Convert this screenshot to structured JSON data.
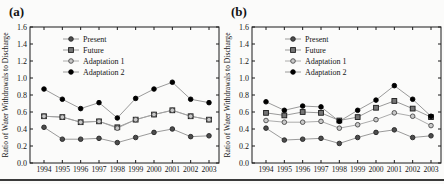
{
  "figure": {
    "background": "#fbfbfa",
    "frame_color": "#1a1a1a",
    "bottom_rule_color": "#3a3a3a"
  },
  "chart_data": [
    {
      "type": "line",
      "panel_label": "(a)",
      "title": "",
      "xlabel": "",
      "ylabel": "Ratio of Water Withdrawals to Discharge",
      "x": [
        1994,
        1995,
        1996,
        1997,
        1998,
        1999,
        2000,
        2001,
        2002,
        2003
      ],
      "ylim": [
        0.0,
        1.6
      ],
      "yticks": [
        0.0,
        0.2,
        0.4,
        0.6,
        0.8,
        1.0,
        1.2,
        1.4,
        1.6
      ],
      "grid": false,
      "legend_position": "upper-left-inside",
      "series": [
        {
          "name": "Present",
          "marker": "circle",
          "marker_fill": "#4d4d4d",
          "marker_stroke": "#262626",
          "line_color": "#8f8f8f",
          "values": [
            0.42,
            0.28,
            0.28,
            0.29,
            0.24,
            0.3,
            0.36,
            0.4,
            0.31,
            0.32
          ]
        },
        {
          "name": "Future",
          "marker": "square",
          "marker_fill": "#757575",
          "marker_stroke": "#1a1a1a",
          "line_color": "#8f8f8f",
          "values": [
            0.55,
            0.54,
            0.48,
            0.49,
            0.42,
            0.51,
            0.57,
            0.62,
            0.55,
            0.51
          ]
        },
        {
          "name": "Adaptation 1",
          "marker": "circle",
          "marker_fill": "#c9c9c9",
          "marker_stroke": "#4a4a4a",
          "line_color": "#a3a3a3",
          "values": [
            0.55,
            0.54,
            0.48,
            0.49,
            0.41,
            0.51,
            0.57,
            0.62,
            0.55,
            0.51
          ]
        },
        {
          "name": "Adaptation 2",
          "marker": "circle",
          "marker_fill": "#000000",
          "marker_stroke": "#000000",
          "line_color": "#8f8f8f",
          "values": [
            0.87,
            0.75,
            0.64,
            0.71,
            0.53,
            0.76,
            0.87,
            0.95,
            0.75,
            0.71
          ]
        }
      ]
    },
    {
      "type": "line",
      "panel_label": "(b)",
      "title": "",
      "xlabel": "",
      "ylabel": "Ratio of Water Withdrawals to Discharge",
      "x": [
        1994,
        1995,
        1996,
        1997,
        1998,
        1999,
        2000,
        2001,
        2002,
        2003
      ],
      "ylim": [
        0.0,
        1.6
      ],
      "yticks": [
        0.0,
        0.2,
        0.4,
        0.6,
        0.8,
        1.0,
        1.2,
        1.4,
        1.6
      ],
      "grid": false,
      "legend_position": "upper-left-inside",
      "series": [
        {
          "name": "Present",
          "marker": "circle",
          "marker_fill": "#4d4d4d",
          "marker_stroke": "#262626",
          "line_color": "#8f8f8f",
          "values": [
            0.41,
            0.27,
            0.28,
            0.29,
            0.23,
            0.3,
            0.36,
            0.39,
            0.3,
            0.32
          ]
        },
        {
          "name": "Future",
          "marker": "square",
          "marker_fill": "#757575",
          "marker_stroke": "#1a1a1a",
          "line_color": "#8f8f8f",
          "values": [
            0.59,
            0.56,
            0.6,
            0.59,
            0.5,
            0.54,
            0.65,
            0.73,
            0.64,
            0.54
          ]
        },
        {
          "name": "Adaptation 1",
          "marker": "circle",
          "marker_fill": "#c9c9c9",
          "marker_stroke": "#4a4a4a",
          "line_color": "#a3a3a3",
          "values": [
            0.5,
            0.48,
            0.48,
            0.49,
            0.41,
            0.45,
            0.51,
            0.59,
            0.55,
            0.44
          ]
        },
        {
          "name": "Adaptation 2",
          "marker": "circle",
          "marker_fill": "#000000",
          "marker_stroke": "#000000",
          "line_color": "#8f8f8f",
          "values": [
            0.72,
            0.62,
            0.67,
            0.66,
            0.49,
            0.62,
            0.74,
            0.91,
            0.75,
            0.55
          ]
        }
      ]
    }
  ]
}
